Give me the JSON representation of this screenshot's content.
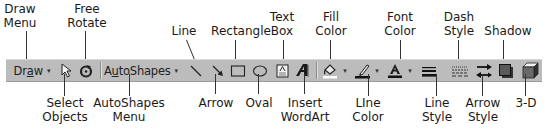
{
  "toolbar": {
    "draw_label_prefix": "Dr",
    "draw_label_underlined": "a",
    "draw_label_suffix": "w",
    "autoshapes_label_prefix": "A",
    "autoshapes_label_underlined": "u",
    "autoshapes_label_suffix": "toShapes",
    "caret": "▾"
  },
  "labels_top": {
    "draw_menu": [
      "Draw",
      "Menu"
    ],
    "free_rotate": [
      "Free",
      "Rotate"
    ],
    "line": [
      "Line"
    ],
    "rectangle": [
      "Rectangle"
    ],
    "text_box": [
      "Text",
      "Box"
    ],
    "fill_color": [
      "Fill",
      "Color"
    ],
    "font_color": [
      "Font",
      "Color"
    ],
    "dash_style": [
      "Dash",
      "Style"
    ],
    "shadow": [
      "Shadow"
    ]
  },
  "labels_bottom": {
    "select_objects": [
      "Select",
      "Objects"
    ],
    "autoshapes_menu": [
      "AutoShapes",
      "Menu"
    ],
    "arrow": [
      "Arrow"
    ],
    "oval": [
      "Oval"
    ],
    "insert_wordart": [
      "Insert",
      "WordArt"
    ],
    "line_color": [
      "LIne",
      "Color"
    ],
    "line_style": [
      "Line",
      "Style"
    ],
    "arrow_style": [
      "Arrow",
      "Style"
    ],
    "three_d": [
      "3-D"
    ]
  },
  "colors": {
    "toolbar_bg": "#bcbcbc",
    "text": "#1a1a1a",
    "leader": "#333333"
  }
}
